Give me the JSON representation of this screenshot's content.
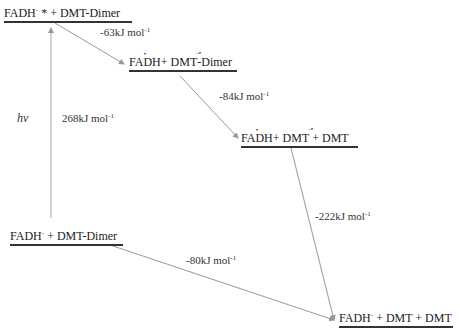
{
  "diagram": {
    "type": "energy-level-diagram",
    "levels": [
      {
        "id": "excited",
        "species": "FADH",
        "charge": "-",
        "mark": "*",
        "rest": " + DMT-Dimer"
      },
      {
        "id": "radical-pair",
        "species": "FADH",
        "rest_a": " + DMT",
        "rest_b": "-Dimer"
      },
      {
        "id": "split-radical",
        "species": "FADH",
        "rest_a": " + DMT",
        "rest_b": " + DMT"
      },
      {
        "id": "ground",
        "species": "FADH",
        "charge": "-",
        "rest": " + DMT-Dimer"
      },
      {
        "id": "product",
        "species": "FADH",
        "charge": "-",
        "rest": " + DMT + DMT"
      }
    ],
    "transitions": [
      {
        "from": "ground",
        "to": "excited",
        "energy": "268kJ mol",
        "unit_exp": "-1",
        "symbol": "hν"
      },
      {
        "from": "excited",
        "to": "radical-pair",
        "energy": "-63kJ mol",
        "unit_exp": "-1"
      },
      {
        "from": "radical-pair",
        "to": "split-radical",
        "energy": "-84kJ mol",
        "unit_exp": "-1"
      },
      {
        "from": "split-radical",
        "to": "product",
        "energy": "-222kJ mol",
        "unit_exp": "-1"
      },
      {
        "from": "ground",
        "to": "product",
        "energy": "-80kJ mol",
        "unit_exp": "-1"
      }
    ],
    "line_color": "#999999",
    "level_bar_color": "#333333"
  }
}
